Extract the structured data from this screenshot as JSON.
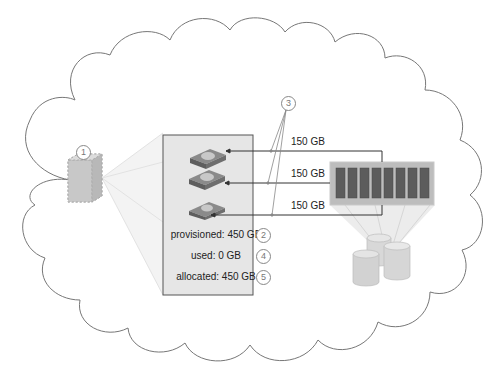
{
  "diagram": {
    "type": "thin-provisioning-illustration",
    "container": "cloud",
    "callouts": [
      {
        "id": "1",
        "target": "virtual-machine"
      },
      {
        "id": "2",
        "target": "provisioned-stat"
      },
      {
        "id": "3",
        "target": "disk-links"
      },
      {
        "id": "4",
        "target": "used-stat"
      },
      {
        "id": "5",
        "target": "allocated-stat"
      }
    ],
    "links": [
      {
        "label": "150 GB"
      },
      {
        "label": "150 GB"
      },
      {
        "label": "150 GB"
      }
    ],
    "stats": {
      "provisioned": "provisioned: 450 GB",
      "used": "used: 0 GB",
      "allocated": "allocated: 450 GB"
    },
    "storage_array": {
      "slot_count": 8
    },
    "colors": {
      "panel_fill": "#e4e4e4",
      "panel_border": "#555555",
      "disk_fill": "#6e6e6e",
      "disk_platter": "#c4c4c4",
      "array_slot": "#5c5c5c",
      "array_body": "#b8b8b8",
      "cloud_stroke": "#777777"
    }
  }
}
